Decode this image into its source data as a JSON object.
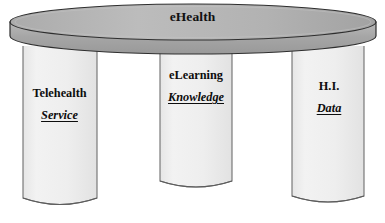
{
  "diagram": {
    "title": "eHealth",
    "platform": {
      "label": "eHealth",
      "shape": "elliptical-disc",
      "fill": "#a8a8a8",
      "top_fill": "#b4b4b4",
      "stroke": "#2b2b2b"
    },
    "pillars": [
      {
        "id": "telehealth",
        "title": "Telehealth",
        "subtitle": "Service",
        "fill": "#efefef",
        "stroke": "#6b6b6b"
      },
      {
        "id": "elearning",
        "title": "eLearning",
        "subtitle": "Knowledge",
        "fill": "#efefef",
        "stroke": "#6b6b6b"
      },
      {
        "id": "health-informatics",
        "title": "H.I.",
        "subtitle": "Data",
        "fill": "#efefef",
        "stroke": "#6b6b6b"
      }
    ],
    "background": "#ffffff"
  }
}
